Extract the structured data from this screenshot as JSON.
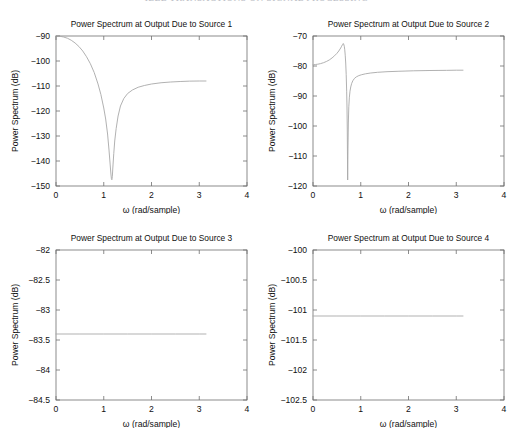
{
  "header": {
    "clipped_text": "IEEE TRANSACTIONS ON SIGNAL PROCESSING"
  },
  "figure": {
    "rows": 2,
    "columns": 2
  },
  "chart_data": [
    {
      "type": "line",
      "title": "Power Spectrum at Output Due to Source 1",
      "xlabel": "ω (rad/sample)",
      "ylabel": "Power Spectrum (dB)",
      "xlim": [
        0,
        4
      ],
      "ylim": [
        -150,
        -90
      ],
      "xticks": [
        0,
        1,
        2,
        3,
        4
      ],
      "xtick_labels": [
        "0",
        "1",
        "2",
        "3",
        "4"
      ],
      "yticks": [
        -150,
        -140,
        -130,
        -120,
        -110,
        -100,
        -90
      ],
      "ytick_labels": [
        "-150",
        "-140",
        "-130",
        "-120",
        "-110",
        "-100",
        "-90"
      ],
      "grid": false,
      "legend": null,
      "series": [
        {
          "name": "source-1-spectrum",
          "x": [
            0.0,
            0.08,
            0.16,
            0.24,
            0.32,
            0.4,
            0.48,
            0.56,
            0.64,
            0.72,
            0.8,
            0.88,
            0.94,
            1.0,
            1.04,
            1.08,
            1.11,
            1.13,
            1.15,
            1.16,
            1.17,
            1.18,
            1.19,
            1.21,
            1.23,
            1.26,
            1.3,
            1.35,
            1.42,
            1.5,
            1.6,
            1.72,
            1.85,
            2.0,
            2.2,
            2.4,
            2.6,
            2.8,
            3.0,
            3.14159
          ],
          "y": [
            -90.0,
            -90.1,
            -90.4,
            -90.9,
            -91.7,
            -92.8,
            -94.2,
            -96.0,
            -98.3,
            -101.1,
            -104.6,
            -109.2,
            -113.4,
            -118.8,
            -123.2,
            -129.2,
            -135.6,
            -140.4,
            -145.2,
            -147.0,
            -147.5,
            -146.2,
            -142.8,
            -137.0,
            -132.0,
            -127.0,
            -122.0,
            -118.0,
            -115.0,
            -113.0,
            -111.6,
            -110.5,
            -109.8,
            -109.2,
            -108.7,
            -108.4,
            -108.2,
            -108.05,
            -108.0,
            -108.0
          ]
        }
      ]
    },
    {
      "type": "line",
      "title": "Power Spectrum at Output Due to Source 2",
      "xlabel": "ω (rad/sample)",
      "ylabel": "Power Spectrum (dB)",
      "xlim": [
        0,
        4
      ],
      "ylim": [
        -120,
        -70
      ],
      "xticks": [
        0,
        1,
        2,
        3,
        4
      ],
      "xtick_labels": [
        "0",
        "1",
        "2",
        "3",
        "4"
      ],
      "yticks": [
        -120,
        -110,
        -100,
        -90,
        -80,
        -70
      ],
      "ytick_labels": [
        "-120",
        "-110",
        "-100",
        "-90",
        "-80",
        "-70"
      ],
      "grid": false,
      "legend": null,
      "series": [
        {
          "name": "source-2-spectrum",
          "x": [
            0.0,
            0.05,
            0.1,
            0.16,
            0.22,
            0.28,
            0.34,
            0.4,
            0.45,
            0.5,
            0.54,
            0.58,
            0.6,
            0.62,
            0.63,
            0.64,
            0.655,
            0.665,
            0.675,
            0.685,
            0.695,
            0.705,
            0.712,
            0.718,
            0.722,
            0.726,
            0.732,
            0.74,
            0.75,
            0.762,
            0.775,
            0.79,
            0.81,
            0.835,
            0.87,
            0.91,
            0.96,
            1.02,
            1.1,
            1.2,
            1.35,
            1.55,
            1.8,
            2.1,
            2.45,
            2.8,
            3.0,
            3.14159
          ],
          "y": [
            -79.6,
            -79.5,
            -79.4,
            -79.2,
            -78.9,
            -78.5,
            -78.0,
            -77.3,
            -76.6,
            -75.8,
            -75.0,
            -74.0,
            -73.4,
            -72.8,
            -72.5,
            -72.6,
            -73.4,
            -74.6,
            -76.4,
            -79.0,
            -82.8,
            -88.4,
            -94.0,
            -101.0,
            -110.0,
            -118.0,
            -108.0,
            -99.0,
            -93.6,
            -90.4,
            -88.4,
            -87.0,
            -85.8,
            -84.9,
            -84.1,
            -83.6,
            -83.2,
            -82.9,
            -82.6,
            -82.35,
            -82.1,
            -81.9,
            -81.75,
            -81.6,
            -81.5,
            -81.45,
            -81.4,
            -81.4
          ]
        }
      ]
    },
    {
      "type": "line",
      "title": "Power Spectrum at Output Due to Source 3",
      "xlabel": "ω (rad/sample)",
      "ylabel": "Power Spectrum (dB)",
      "xlim": [
        0,
        4
      ],
      "ylim": [
        -84.5,
        -82
      ],
      "xticks": [
        0,
        1,
        2,
        3,
        4
      ],
      "xtick_labels": [
        "0",
        "1",
        "2",
        "3",
        "4"
      ],
      "yticks": [
        -84.5,
        -84,
        -83.5,
        -83,
        -82.5,
        -82
      ],
      "ytick_labels": [
        "-84.5",
        "-84",
        "-83.5",
        "-83",
        "-82.5",
        "-82"
      ],
      "grid": false,
      "legend": null,
      "series": [
        {
          "name": "source-3-spectrum",
          "x": [
            0.0,
            0.5,
            1.0,
            1.5,
            2.0,
            2.5,
            3.0,
            3.14159
          ],
          "y": [
            -83.4,
            -83.4,
            -83.4,
            -83.4,
            -83.4,
            -83.4,
            -83.4,
            -83.4
          ]
        }
      ]
    },
    {
      "type": "line",
      "title": "Power Spectrum at Output Due to Source 4",
      "xlabel": "ω (rad/sample)",
      "ylabel": "Power Spectrum (dB)",
      "xlim": [
        0,
        4
      ],
      "ylim": [
        -102.5,
        -100
      ],
      "xticks": [
        0,
        1,
        2,
        3,
        4
      ],
      "xtick_labels": [
        "0",
        "1",
        "2",
        "3",
        "4"
      ],
      "yticks": [
        -102.5,
        -102,
        -101.5,
        -101,
        -100.5,
        -100
      ],
      "ytick_labels": [
        "-102.5",
        "-102",
        "-101.5",
        "-101",
        "-100.5",
        "-100"
      ],
      "grid": false,
      "legend": null,
      "series": [
        {
          "name": "source-4-spectrum",
          "x": [
            0.0,
            0.5,
            1.0,
            1.5,
            2.0,
            2.5,
            3.0,
            3.14159
          ],
          "y": [
            -101.1,
            -101.1,
            -101.1,
            -101.1,
            -101.1,
            -101.1,
            -101.1,
            -101.1
          ]
        }
      ]
    }
  ]
}
